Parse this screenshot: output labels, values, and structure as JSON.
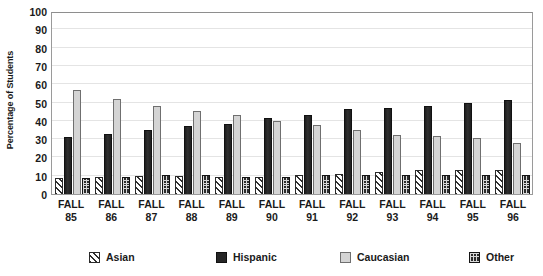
{
  "chart_data": {
    "type": "bar",
    "title": "",
    "xlabel": "",
    "ylabel": "Percentage of Students",
    "ylim": [
      0,
      100
    ],
    "yticks": [
      0,
      10,
      20,
      30,
      40,
      50,
      60,
      70,
      80,
      90,
      100
    ],
    "grid": true,
    "legend_position": "bottom",
    "categories": [
      "FALL 85",
      "FALL 86",
      "FALL 87",
      "FALL 88",
      "FALL 89",
      "FALL 90",
      "FALL 91",
      "FALL 92",
      "FALL 93",
      "FALL 94",
      "FALL 95",
      "FALL 96"
    ],
    "category_lines": [
      {
        "line1": "FALL",
        "line2": "85"
      },
      {
        "line1": "FALL",
        "line2": "86"
      },
      {
        "line1": "FALL",
        "line2": "87"
      },
      {
        "line1": "FALL",
        "line2": "88"
      },
      {
        "line1": "FALL",
        "line2": "89"
      },
      {
        "line1": "FALL",
        "line2": "90"
      },
      {
        "line1": "FALL",
        "line2": "91"
      },
      {
        "line1": "FALL",
        "line2": "92"
      },
      {
        "line1": "FALL",
        "line2": "93"
      },
      {
        "line1": "FALL",
        "line2": "94"
      },
      {
        "line1": "FALL",
        "line2": "95"
      },
      {
        "line1": "FALL",
        "line2": "96"
      }
    ],
    "series": [
      {
        "name": "Asian",
        "pattern": "diagonal-hatch",
        "color": "#ffffff",
        "values": [
          9,
          9.5,
          10,
          10,
          9.5,
          9.5,
          10.5,
          11,
          12,
          13,
          13,
          13
        ]
      },
      {
        "name": "Hispanic",
        "pattern": "solid",
        "color": "#262626",
        "values": [
          31,
          33,
          35,
          37,
          38.5,
          41.5,
          43,
          46.5,
          47,
          48,
          50,
          51.5
        ]
      },
      {
        "name": "Caucasian",
        "pattern": "solid-light",
        "color": "#d4d4d4",
        "values": [
          57,
          52,
          48,
          45.5,
          43,
          40,
          37.5,
          35,
          32.5,
          31.5,
          30.5,
          28
        ]
      },
      {
        "name": "Other",
        "pattern": "dotted-grid",
        "color": "#2b2b2b",
        "values": [
          9,
          9.5,
          10.5,
          10.5,
          9.5,
          9.5,
          10.5,
          10.5,
          10.5,
          10.5,
          10.5,
          10.5
        ]
      }
    ]
  },
  "legend": {
    "items": [
      {
        "label": "Asian",
        "swatch": "asian"
      },
      {
        "label": "Hispanic",
        "swatch": "hispanic"
      },
      {
        "label": "Caucasian",
        "swatch": "caucasian"
      },
      {
        "label": "Other",
        "swatch": "other"
      }
    ]
  }
}
